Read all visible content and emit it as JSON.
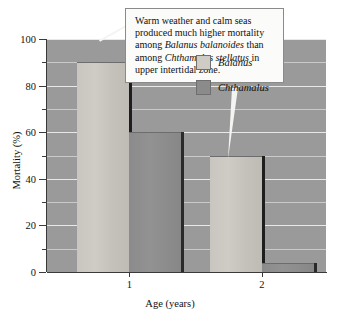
{
  "chart_data": {
    "type": "bar",
    "title": "",
    "xlabel": "Age (years)",
    "ylabel": "Mortality (%)",
    "categories": [
      "1",
      "2"
    ],
    "series": [
      {
        "name": "Balanus",
        "values": [
          90,
          50
        ]
      },
      {
        "name": "Chthamalus",
        "values": [
          60,
          4
        ]
      }
    ],
    "ylim": [
      0,
      100
    ],
    "yticks": [
      0,
      20,
      40,
      60,
      80,
      100
    ],
    "yticks_minor": [
      10,
      30,
      50,
      70,
      90
    ],
    "grid": true,
    "legend_position": "inside-right"
  },
  "axes": {
    "y_title": "Mortality (%)",
    "x_title": "Age (years)",
    "y_tick_labels": [
      "0",
      "20",
      "40",
      "60",
      "80",
      "100"
    ],
    "x_tick_labels": [
      "1",
      "2"
    ]
  },
  "legend": {
    "items": [
      {
        "label": "Balanus",
        "swatch": "light"
      },
      {
        "label": "Chthamalus",
        "swatch": "dark"
      }
    ]
  },
  "callout": {
    "line1_a": "Warm weather and calm seas",
    "line2_a": "produced much higher mortality",
    "line3_a": "among ",
    "line3_i": "Balanus balanoides",
    "line3_b": " than",
    "line4_a": "among ",
    "line4_i": "Chthamalus stellatus",
    "line4_b": " in",
    "line5_a": "upper intertidal zone."
  },
  "colors": {
    "plot_background": "#9a9a9a",
    "gridline": "#e8e8e8",
    "bar_light": "#cfccc6",
    "bar_dark": "#8b8b8b",
    "bar_shadow": "#1e1e1e",
    "callout_background": "#fbfbf9",
    "callout_border": "#8a8a8a",
    "text": "#111111"
  }
}
